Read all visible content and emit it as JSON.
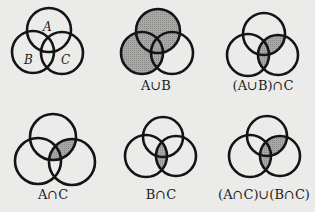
{
  "colors": {
    "background": "#ebebe9",
    "stroke": "#141414",
    "shade": "#9c9c9a"
  },
  "panels": [
    {
      "id": "venn-base",
      "label": "",
      "shaded": "none",
      "circles": {
        "A": {
          "cx": 49,
          "cy": 30,
          "r": 22
        },
        "B": {
          "cx": 33,
          "cy": 52,
          "r": 21
        },
        "C": {
          "cx": 62,
          "cy": 53,
          "r": 21
        }
      },
      "set_labels": [
        {
          "text": "A",
          "x": 43,
          "y": 31
        },
        {
          "text": "B",
          "x": 24,
          "y": 64
        },
        {
          "text": "C",
          "x": 61,
          "y": 64
        }
      ]
    },
    {
      "id": "venn-a-union-b",
      "label": "A∪B",
      "label_pos": {
        "x": 156,
        "y": 90
      },
      "shaded": "A_union_B",
      "circles": {
        "A": {
          "cx": 158,
          "cy": 31,
          "r": 22
        },
        "B": {
          "cx": 142,
          "cy": 53,
          "r": 21
        },
        "C": {
          "cx": 172,
          "cy": 53,
          "r": 21
        }
      }
    },
    {
      "id": "venn-a-union-b-intersect-c",
      "label": "(A∪B)∩C",
      "label_pos": {
        "x": 263,
        "y": 90
      },
      "shaded": "A_union_B_intersect_C",
      "circles": {
        "A": {
          "cx": 264,
          "cy": 34,
          "r": 21
        },
        "B": {
          "cx": 248,
          "cy": 55,
          "r": 21
        },
        "C": {
          "cx": 278,
          "cy": 55,
          "r": 20
        }
      }
    },
    {
      "id": "venn-a-intersect-c",
      "label": "A∩C",
      "label_pos": {
        "x": 53,
        "y": 199
      },
      "shaded": "A_intersect_C",
      "circles": {
        "A": {
          "cx": 53,
          "cy": 137,
          "r": 23
        },
        "B": {
          "cx": 38,
          "cy": 161,
          "r": 23
        },
        "C": {
          "cx": 72,
          "cy": 162,
          "r": 23
        }
      }
    },
    {
      "id": "venn-b-intersect-c",
      "label": "B∩C",
      "label_pos": {
        "x": 161,
        "y": 199
      },
      "shaded": "B_intersect_C",
      "circles": {
        "A": {
          "cx": 163,
          "cy": 137,
          "r": 20
        },
        "B": {
          "cx": 146,
          "cy": 156,
          "r": 21
        },
        "C": {
          "cx": 176,
          "cy": 156,
          "r": 20
        }
      }
    },
    {
      "id": "venn-a-int-c-union-b-int-c",
      "label": "(A∩C)∪(B∩C)",
      "label_pos": {
        "x": 264,
        "y": 199
      },
      "shaded": "A_int_C_union_B_int_C",
      "circles": {
        "A": {
          "cx": 267,
          "cy": 136,
          "r": 20
        },
        "B": {
          "cx": 250,
          "cy": 156,
          "r": 21
        },
        "C": {
          "cx": 280,
          "cy": 156,
          "r": 20
        }
      }
    }
  ]
}
